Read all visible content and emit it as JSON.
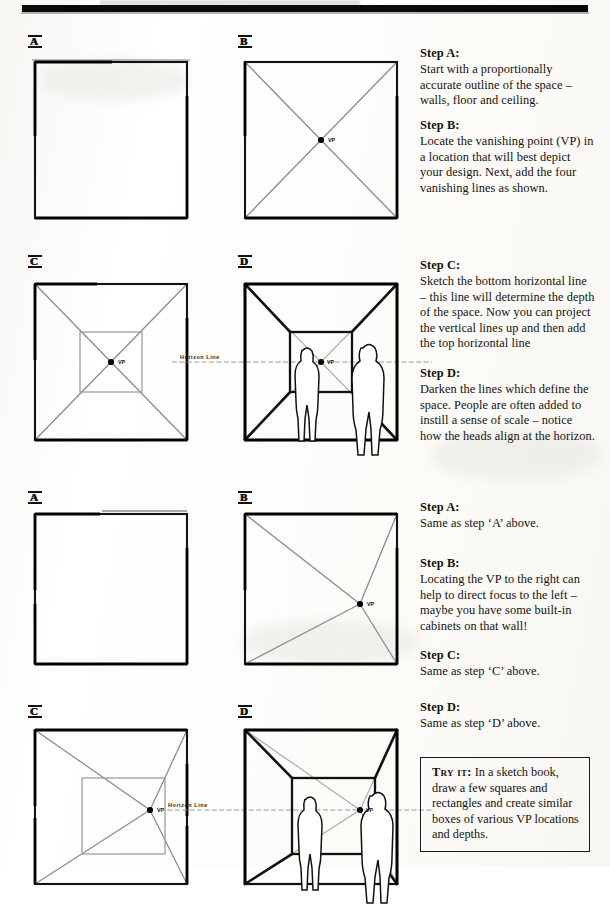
{
  "page": {
    "width": 610,
    "height": 867,
    "background": "#ffffff",
    "ink": "#15120f",
    "rule_color": "#0a0a0a"
  },
  "text_column": {
    "blocks": [
      {
        "id": "step-a-1",
        "heading": "Step A:",
        "body": "Start with a proportionally accurate outline of the space – walls, floor and ceiling."
      },
      {
        "id": "step-b-1",
        "heading": "Step B:",
        "body": "Locate the vanishing point (VP) in a location that will best depict your design. Next, add the four vanishing lines as shown."
      },
      {
        "id": "step-c-1",
        "heading": "Step C:",
        "body": "Sketch the bottom horizontal line – this line will determine the depth of the space. Now you can project the vertical lines up and then add the top horizontal line"
      },
      {
        "id": "step-d-1",
        "heading": "Step D:",
        "body": "Darken the lines which define the space. People are often added to instill a sense of scale – notice how the heads align at the horizon."
      },
      {
        "id": "step-a-2",
        "heading": "Step A:",
        "body": "Same as step ‘A’ above."
      },
      {
        "id": "step-b-2",
        "heading": "Step B:",
        "body": "Locating the VP to the right can help to direct focus to the left – maybe you have some built-in cabinets on that wall!"
      },
      {
        "id": "step-c-2",
        "heading": "Step C:",
        "body": "Same as step ‘C’ above."
      },
      {
        "id": "step-d-2",
        "heading": "Step D:",
        "body": "Same as step ‘D’ above."
      }
    ]
  },
  "try_it": {
    "label": "Try it:",
    "body": "In a sketch book, draw a few squares and rectangles and create similar boxes of various VP locations and depths."
  },
  "figures": [
    {
      "id": "fig-1a",
      "tag": "A",
      "caption_step": "Step A",
      "description": "Plain square outline of the space",
      "vp_label": null,
      "horizon_label": null,
      "has_inner_box": false,
      "has_diagonals": false,
      "has_people": false
    },
    {
      "id": "fig-1b",
      "tag": "B",
      "caption_step": "Step B",
      "description": "Square with centered vanishing point and four vanishing lines",
      "vp_label": "VP",
      "horizon_label": null,
      "has_inner_box": false,
      "has_diagonals": true,
      "has_people": false
    },
    {
      "id": "fig-2a",
      "tag": "C",
      "caption_step": "Step C",
      "description": "Square with inner back-wall rectangle projected from the centered VP",
      "vp_label": "VP",
      "horizon_label": null,
      "has_inner_box": true,
      "has_diagonals": true,
      "has_people": false
    },
    {
      "id": "fig-2b",
      "tag": "D",
      "caption_step": "Step D",
      "description": "Darkened room box with horizon line and two standing figures",
      "vp_label": "VP",
      "horizon_label": "Horizon  Line",
      "has_inner_box": true,
      "has_diagonals": true,
      "has_people": true
    },
    {
      "id": "fig-3a",
      "tag": "A",
      "caption_step": "Step A",
      "description": "Plain square outline of the space",
      "vp_label": null,
      "horizon_label": null,
      "has_inner_box": false,
      "has_diagonals": false,
      "has_people": false
    },
    {
      "id": "fig-3b",
      "tag": "B",
      "caption_step": "Step B",
      "description": "Square with vanishing point offset to the right and four vanishing lines",
      "vp_label": "VP",
      "horizon_label": null,
      "has_inner_box": false,
      "has_diagonals": true,
      "has_people": false
    },
    {
      "id": "fig-4a",
      "tag": "C",
      "caption_step": "Step C",
      "description": "Square with inner back-wall rectangle projected from the right-offset VP",
      "vp_label": "VP",
      "horizon_label": null,
      "has_inner_box": true,
      "has_diagonals": true,
      "has_people": false
    },
    {
      "id": "fig-4b",
      "tag": "D",
      "caption_step": "Step D",
      "description": "Darkened room box with right-offset VP, horizon line and two standing figures",
      "vp_label": "VP",
      "horizon_label": "Horizon  Line",
      "has_inner_box": true,
      "has_diagonals": true,
      "has_people": true
    }
  ]
}
